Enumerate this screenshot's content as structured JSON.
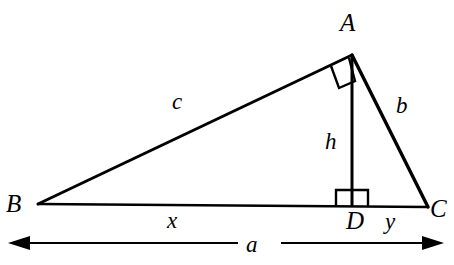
{
  "figure": {
    "background_color": "#ffffff",
    "stroke_color": "#000000",
    "vertices": {
      "A": {
        "label": "A",
        "x": 352,
        "y": 55
      },
      "B": {
        "label": "B",
        "x": 38,
        "y": 204
      },
      "C": {
        "label": "C",
        "x": 428,
        "y": 207
      },
      "D": {
        "label": "D",
        "x": 352,
        "y": 207
      }
    },
    "segments": {
      "c": {
        "label": "c",
        "from": "B",
        "to": "A"
      },
      "b": {
        "label": "b",
        "from": "A",
        "to": "C"
      },
      "h": {
        "label": "h",
        "from": "A",
        "to": "D"
      },
      "x": {
        "label": "x",
        "from": "B",
        "to": "D"
      },
      "y": {
        "label": "y",
        "from": "D",
        "to": "C"
      },
      "a": {
        "label": "a",
        "from": "B",
        "to": "C"
      }
    },
    "right_angles": [
      {
        "at": "A",
        "between": [
          "c",
          "h"
        ]
      },
      {
        "at": "D",
        "between": [
          "h",
          "a"
        ]
      }
    ],
    "dimension": {
      "label": "a",
      "left_arrow": "arrow-left",
      "right_arrow": "arrow-right",
      "y": 243,
      "x_start": 22,
      "x_end": 428
    }
  }
}
